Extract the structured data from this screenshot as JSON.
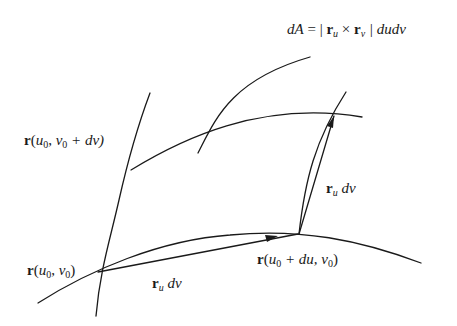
{
  "figure": {
    "formula": {
      "lhs": "dA",
      "eq": " = | ",
      "r1": "r",
      "sub1": "u",
      "cross": " × ",
      "r2": "r",
      "sub2": "v",
      "tail": " | dudv"
    },
    "label_top_left": {
      "r": "r",
      "open": "(",
      "u": "u",
      "u_sub": "0",
      "comma": ", ",
      "v": "v",
      "v_sub": "0",
      "rest": " + dv)"
    },
    "label_origin": {
      "r": "r",
      "open": "(",
      "u": "u",
      "u_sub": "0",
      "comma": ", ",
      "v": "v",
      "v_sub": "0",
      "close": ")"
    },
    "label_bottom_right": {
      "r": "r",
      "open": "(",
      "u": "u",
      "u_sub": "0",
      "rest": " + du, ",
      "v": "v",
      "v_sub": "0",
      "close": ")"
    },
    "vector_bottom": {
      "r": "r",
      "sub": "u",
      "d": " dv"
    },
    "vector_right": {
      "r": "r",
      "sub": "u",
      "d": " dv"
    },
    "stroke_color": "#1a1a1a"
  }
}
